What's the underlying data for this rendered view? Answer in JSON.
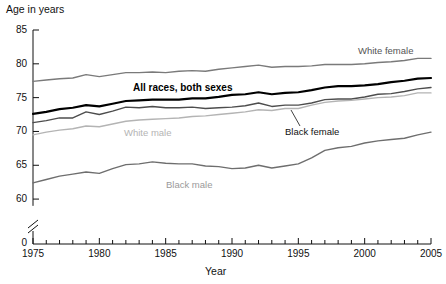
{
  "chart_data": {
    "type": "line",
    "title": "",
    "xlabel": "Year",
    "ylabel": "Age in years",
    "ylabel_position": "top-left",
    "grid": false,
    "legend": "inline-annotations",
    "xlim": [
      1975,
      2005
    ],
    "ylim": [
      57.5,
      85
    ],
    "y_axis_break": true,
    "y_axis_break_note": "axis broken between 0 and 60",
    "y_ticks": [
      60,
      65,
      70,
      75,
      80,
      85
    ],
    "y_tick_labels": [
      "60",
      "65",
      "70",
      "75",
      "80",
      "85"
    ],
    "y_zero_label": "0",
    "x_ticks": [
      1975,
      1976,
      1977,
      1978,
      1979,
      1980,
      1981,
      1982,
      1983,
      1984,
      1985,
      1986,
      1987,
      1988,
      1989,
      1990,
      1991,
      1992,
      1993,
      1994,
      1995,
      1996,
      1997,
      1998,
      1999,
      2000,
      2001,
      2002,
      2003,
      2004,
      2005
    ],
    "x_tick_labels": [
      "1975",
      "1980",
      "1985",
      "1990",
      "1995",
      "2000",
      "2005"
    ],
    "x_labeled_ticks": [
      1975,
      1980,
      1985,
      1990,
      1995,
      2000,
      2005
    ],
    "x": [
      1975,
      1976,
      1977,
      1978,
      1979,
      1980,
      1981,
      1982,
      1983,
      1984,
      1985,
      1986,
      1987,
      1988,
      1989,
      1990,
      1991,
      1992,
      1993,
      1994,
      1995,
      1996,
      1997,
      1998,
      1999,
      2000,
      2001,
      2002,
      2003,
      2004,
      2005
    ],
    "series": [
      {
        "name": "White female",
        "color": "#7a7a7a",
        "width": 1.4,
        "label_text": "White female",
        "values": [
          77.4,
          77.6,
          77.8,
          77.9,
          78.4,
          78.1,
          78.4,
          78.7,
          78.7,
          78.8,
          78.7,
          78.9,
          79.0,
          78.9,
          79.2,
          79.4,
          79.6,
          79.8,
          79.5,
          79.6,
          79.6,
          79.7,
          79.9,
          79.9,
          79.9,
          80.0,
          80.2,
          80.3,
          80.5,
          80.8,
          80.8
        ]
      },
      {
        "name": "All races, both sexes",
        "color": "#000000",
        "width": 2.2,
        "label_text": "All races, both sexes",
        "values": [
          72.6,
          72.9,
          73.3,
          73.5,
          73.9,
          73.7,
          74.1,
          74.5,
          74.6,
          74.7,
          74.7,
          74.7,
          74.9,
          74.9,
          75.1,
          75.4,
          75.5,
          75.8,
          75.5,
          75.7,
          75.8,
          76.1,
          76.5,
          76.7,
          76.7,
          76.8,
          77.0,
          77.3,
          77.5,
          77.8,
          77.9
        ]
      },
      {
        "name": "Black female",
        "color": "#4d4d4d",
        "width": 1.4,
        "label_text": "Black female",
        "values": [
          71.3,
          71.6,
          72.0,
          72.0,
          72.9,
          72.5,
          73.0,
          73.6,
          73.5,
          73.7,
          73.5,
          73.5,
          73.6,
          73.4,
          73.5,
          73.6,
          73.8,
          74.2,
          73.7,
          73.9,
          73.9,
          74.2,
          74.7,
          74.8,
          74.8,
          75.1,
          75.5,
          75.6,
          75.9,
          76.3,
          76.5
        ]
      },
      {
        "name": "White male",
        "color": "#b4b4b4",
        "width": 1.4,
        "label_text": "White male",
        "values": [
          69.5,
          69.9,
          70.2,
          70.4,
          70.8,
          70.7,
          71.1,
          71.5,
          71.7,
          71.8,
          71.9,
          72.0,
          72.2,
          72.3,
          72.5,
          72.7,
          72.9,
          73.2,
          73.1,
          73.4,
          73.4,
          73.9,
          74.3,
          74.5,
          74.6,
          74.8,
          75.0,
          75.1,
          75.3,
          75.7,
          75.7
        ]
      },
      {
        "name": "Black male",
        "color": "#6e6e6e",
        "width": 1.4,
        "label_text": "Black male",
        "values": [
          62.4,
          62.9,
          63.4,
          63.7,
          64.0,
          63.8,
          64.5,
          65.1,
          65.2,
          65.5,
          65.3,
          65.2,
          65.2,
          64.9,
          64.8,
          64.5,
          64.6,
          65.0,
          64.6,
          64.9,
          65.2,
          66.1,
          67.2,
          67.6,
          67.8,
          68.3,
          68.6,
          68.8,
          69.0,
          69.5,
          69.9
        ]
      }
    ]
  },
  "axes": {
    "ylabel": "Age in years",
    "xlabel": "Year"
  }
}
